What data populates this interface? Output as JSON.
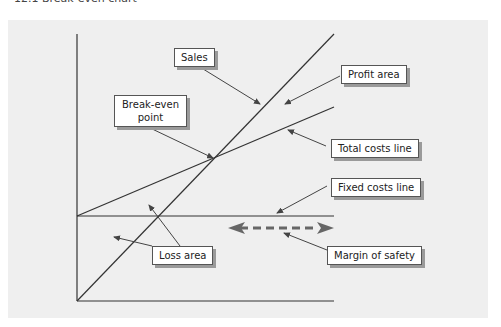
{
  "caption": "12.1 Break-even chart",
  "labels": {
    "sales": "Sales",
    "profit_area": "Profit area",
    "break_even_line1": "Break-even",
    "break_even_line2": "point",
    "total_costs": "Total costs line",
    "fixed_costs": "Fixed costs line",
    "loss_area": "Loss area",
    "margin_of_safety": "Margin of safety"
  },
  "colors": {
    "background": "#efefef",
    "line": "#444444",
    "margin_arrow": "#666666"
  }
}
